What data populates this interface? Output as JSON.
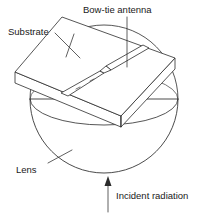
{
  "figure": {
    "type": "technical-line-diagram",
    "background_color": "#ffffff",
    "line_color": "#2b2b2b",
    "text_color": "#1a1a1a"
  },
  "labels": {
    "substrate": "Substrate",
    "antenna": "Bow-tie antenna",
    "lens": "Lens",
    "incident": "Incident radiation"
  },
  "components": {
    "substrate": {
      "name": "Substrate",
      "shape": "rectangular-slab-isometric",
      "top_face": "62,17 175,58 121,116 15,72",
      "thickness_px": 11
    },
    "antenna": {
      "name": "Bow-tie antenna",
      "shape": "bow-tie-two-trapezoids",
      "orientation": "diagonal-on-top-face"
    },
    "lens": {
      "name": "Lens",
      "shape": "hemisphere",
      "center_x": 104,
      "center_y": 100,
      "radius_px": 74
    },
    "incident_radiation": {
      "name": "Incident radiation",
      "direction": "upward",
      "arrow_from_y": 212,
      "arrow_to_y": 176
    }
  },
  "leaders": [
    {
      "name": "substrate-leader",
      "from": "Substrate label",
      "to": "slab top-left edge"
    },
    {
      "name": "antenna-leader",
      "from": "Bow-tie antenna label",
      "to": "antenna body"
    },
    {
      "name": "lens-leader",
      "from": "Lens label",
      "to": "hemisphere surface"
    }
  ]
}
